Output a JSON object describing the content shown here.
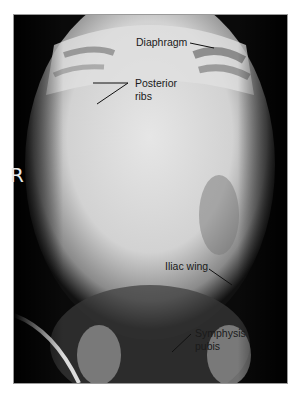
{
  "image": {
    "subject": "Abdominal radiograph (AP view) of infant",
    "side_marker": "R",
    "labels": {
      "diaphragm": "Diaphragm",
      "posterior_ribs_line1": "Posterior",
      "posterior_ribs_line2": "ribs",
      "iliac_wing": "Iliac wing",
      "symphysis_line1": "Symphysis",
      "symphysis_line2": "pubis"
    },
    "colors": {
      "frame_border": "#9a9a9a",
      "label_text": "#1a1a1a",
      "marker": "#e8e8e8"
    }
  }
}
